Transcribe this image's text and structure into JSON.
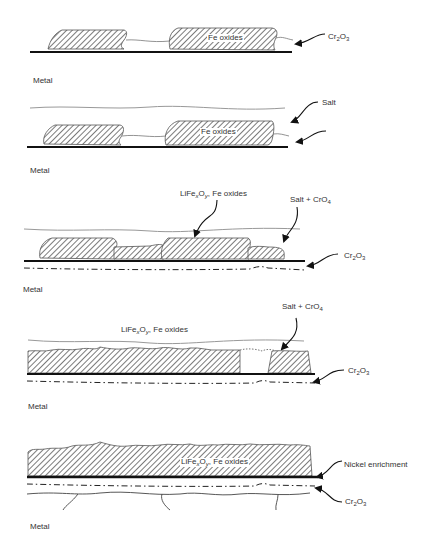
{
  "panels": [
    {
      "id": 1,
      "labels": {
        "oxide": "Fe oxides",
        "layer_base": "Cr",
        "layer_sub1": "2",
        "layer_mid": "O",
        "layer_sub2": "3",
        "metal": "Metal"
      }
    },
    {
      "id": 2,
      "labels": {
        "salt": "Salt",
        "oxide": "Fe oxides",
        "metal": "Metal"
      }
    },
    {
      "id": 3,
      "labels": {
        "mixed_a": "LiFe",
        "mixed_x": "x",
        "mixed_b": "O",
        "mixed_y": "y",
        "mixed_c": ", Fe oxides",
        "salt_a": "Salt + CrO",
        "salt_sub": "4",
        "layer_base": "Cr",
        "layer_sub1": "2",
        "layer_mid": "O",
        "layer_sub2": "3",
        "metal": "Metal"
      }
    },
    {
      "id": 4,
      "labels": {
        "salt_a": "Salt + CrO",
        "salt_sub": "4",
        "mixed_a": "LiFe",
        "mixed_x": "x",
        "mixed_b": "O",
        "mixed_y": "y",
        "mixed_c": ", Fe oxides",
        "layer_base": "Cr",
        "layer_sub1": "2",
        "layer_mid": "O",
        "layer_sub2": "3",
        "metal": "Metal"
      }
    },
    {
      "id": 5,
      "labels": {
        "mixed_a": "LiFe",
        "mixed_x": "x",
        "mixed_b": "O",
        "mixed_y": "y",
        "mixed_c": ", Fe oxides",
        "nickel": "Nickel enrichment",
        "layer_base": "Cr",
        "layer_sub1": "2",
        "layer_mid": "O",
        "layer_sub2": "3",
        "metal": "Metal"
      }
    }
  ],
  "colors": {
    "line": "#1a1a1a",
    "salt_line": "#9a9a9a",
    "hatch": "#333333"
  }
}
